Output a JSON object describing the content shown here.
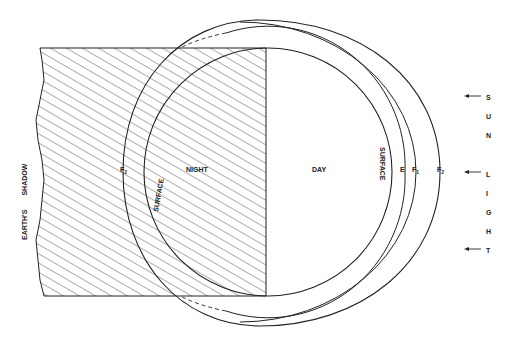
{
  "diagram": {
    "left_label": {
      "word1": "EARTH'S",
      "word2": "SHADOW"
    },
    "regions": {
      "night": "NIGHT",
      "day": "DAY"
    },
    "surface_labels": {
      "night": "SURFACE",
      "day": "SURFACE"
    },
    "layers": {
      "night_f2": {
        "base": "F",
        "sub": "2"
      },
      "day_e": {
        "base": "E",
        "sub": ""
      },
      "day_f1": {
        "base": "F",
        "sub": "1"
      },
      "day_f2": {
        "base": "F",
        "sub": "2"
      }
    },
    "sunlight_letters": [
      "S",
      "U",
      "N",
      "L",
      "I",
      "G",
      "H",
      "T"
    ],
    "colors": {
      "ink": "#222222",
      "background": "#ffffff"
    }
  }
}
